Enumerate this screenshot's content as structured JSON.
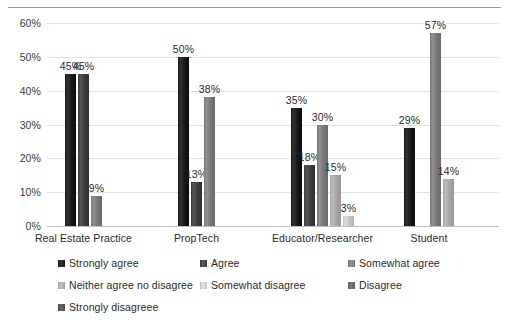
{
  "chart_data": {
    "type": "bar",
    "title": "",
    "subtitle": "",
    "xlabel": "",
    "ylabel": "",
    "categories": [
      "Real Estate Practice",
      "PropTech",
      "Educator/Researcher",
      "Student"
    ],
    "ylim": [
      0,
      60
    ],
    "ytick_labels": [
      "0%",
      "10%",
      "20%",
      "30%",
      "40%",
      "50%",
      "60%"
    ],
    "ytick_values": [
      0,
      10,
      20,
      30,
      40,
      50,
      60
    ],
    "grid": true,
    "legend_position": "bottom",
    "value_label_suffix": "%",
    "series": [
      {
        "name": "Strongly agree",
        "color": "#171717",
        "values": [
          45,
          50,
          35,
          29
        ],
        "labels": [
          "45%",
          "50%",
          "35%",
          "29%"
        ]
      },
      {
        "name": "Agree",
        "color": "#3b3b3b",
        "values": [
          45,
          13,
          18,
          null
        ],
        "labels": [
          "45%",
          "13%",
          "18%",
          ""
        ]
      },
      {
        "name": "Somewhat agree",
        "color": "#767676",
        "values": [
          9,
          38,
          30,
          57
        ],
        "labels": [
          "9%",
          "38%",
          "30%",
          "57%"
        ]
      },
      {
        "name": "Neither agree no disagree",
        "color": "#a3a3a3",
        "values": [
          null,
          null,
          15,
          14
        ],
        "labels": [
          "",
          "",
          "15%",
          "14%"
        ]
      },
      {
        "name": "Somewhat disagree",
        "color": "#c2c2c2",
        "values": [
          null,
          null,
          3,
          null
        ],
        "labels": [
          "",
          "",
          "3%",
          ""
        ]
      },
      {
        "name": "Disagree",
        "color": "#5e5e5e",
        "values": [
          null,
          null,
          null,
          null
        ],
        "labels": [
          "",
          "",
          "",
          ""
        ]
      },
      {
        "name": "Strongly disagreee",
        "color": "#4a4a4a",
        "values": [
          null,
          null,
          null,
          null
        ],
        "labels": [
          "",
          "",
          "",
          ""
        ]
      }
    ]
  },
  "legend": {
    "items": [
      {
        "label": "Strongly agree",
        "color": "#171717",
        "col": 0,
        "row": 0
      },
      {
        "label": "Agree",
        "color": "#3b3b3b",
        "col": 1,
        "row": 0
      },
      {
        "label": "Somewhat agree",
        "color": "#767676",
        "col": 2,
        "row": 0
      },
      {
        "label": "Neither agree no disagree",
        "color": "#a3a3a3",
        "col": 0,
        "row": 1
      },
      {
        "label": "Somewhat disagree",
        "color": "#c2c2c2",
        "col": 1,
        "row": 1
      },
      {
        "label": "Disagree",
        "color": "#5e5e5e",
        "col": 2,
        "row": 1
      },
      {
        "label": "Strongly disagreee",
        "color": "#4a4a4a",
        "col": 0,
        "row": 2
      }
    ]
  },
  "axis": {
    "grid_color": "#e2e2e2",
    "baseline_color": "#bdbdbd",
    "top_rule_color": "#9c9c9c"
  }
}
